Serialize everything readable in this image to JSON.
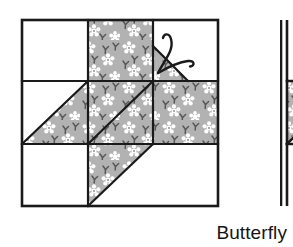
{
  "figure": {
    "title": "Butterfly",
    "kind": "quilt-block-diagram",
    "caption_label": "Butterfly",
    "colors": {
      "fabric_gray": "#b0b0b0",
      "fabric_flower": "#ffffff",
      "fabric_sprig": "#585858",
      "background_white": "#ffffff",
      "outline_black": "#1a1a1a",
      "antenna_black": "#1a1a1a"
    },
    "blocks": [
      {
        "name": "butterfly-block-primary",
        "x": 22,
        "y": 20,
        "size": 196,
        "grid_rows": 3,
        "grid_cols": 3,
        "cells": [
          {
            "name": "cell-top-left",
            "row": 0,
            "col": 0,
            "fill": "white"
          },
          {
            "name": "cell-top-center",
            "row": 0,
            "col": 1,
            "fill": "fabric"
          },
          {
            "name": "cell-top-right",
            "row": 0,
            "col": 2,
            "fill": "white-with-corner-triangle"
          },
          {
            "name": "cell-middle-left",
            "row": 1,
            "col": 0,
            "fill": "half-fabric-lower-right"
          },
          {
            "name": "cell-middle-center",
            "row": 1,
            "col": 1,
            "fill": "fabric"
          },
          {
            "name": "cell-middle-right",
            "row": 1,
            "col": 2,
            "fill": "fabric"
          },
          {
            "name": "cell-bottom-left",
            "row": 2,
            "col": 0,
            "fill": "white"
          },
          {
            "name": "cell-bottom-center",
            "row": 2,
            "col": 1,
            "fill": "half-fabric-upper-left"
          },
          {
            "name": "cell-bottom-right",
            "row": 2,
            "col": 2,
            "fill": "white"
          }
        ],
        "antennae": [
          {
            "name": "antenna-left",
            "curve": "up-curl"
          },
          {
            "name": "antenna-right",
            "curve": "right-curl"
          }
        ]
      },
      {
        "name": "butterfly-block-secondary",
        "x": 280,
        "y": 20,
        "size": 196,
        "clipped": true
      }
    ]
  }
}
